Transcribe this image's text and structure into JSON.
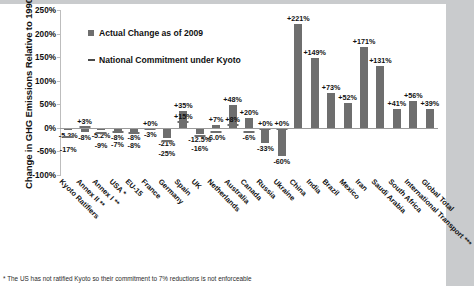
{
  "legend": {
    "series_actual": "Actual Change as of 2009",
    "series_commitment": "National Commitment under Kyoto",
    "marker_actual": "square-marker",
    "marker_commitment": "dash-marker"
  },
  "footnote": "* The US has not ratified Kyoto so their commitment to 7% reductions is not enforceable",
  "chart_data": {
    "type": "bar",
    "title": "",
    "xlabel": "",
    "ylabel": "Change in GHG Emissions Relative to 1990",
    "ylim": [
      -100,
      250
    ],
    "yticks": [
      "250%",
      "200%",
      "150%",
      "100%",
      "50%",
      "0%",
      "-50%",
      "-100%"
    ],
    "ytick_values": [
      250,
      200,
      150,
      100,
      50,
      0,
      -50,
      -100
    ],
    "grid": false,
    "legend_position": "upper-left-inside",
    "categories": [
      "Kyoto Ratifiers",
      "Annex II **",
      "Annex I **",
      "USA *",
      "EU-15",
      "France",
      "Germany",
      "Spain",
      "UK",
      "Netherlands",
      "Australia",
      "Canada",
      "Russia",
      "Ukraine",
      "China",
      "India",
      "Brazil",
      "Mexico",
      "Iran",
      "Saudi Arabia",
      "South Africa",
      "International Transport ***",
      "Global Total"
    ],
    "series": [
      {
        "name": "Actual Change as of 2009",
        "values": [
          -5.2,
          -8,
          -5.2,
          -8,
          -8,
          -3,
          -21,
          35,
          -12.5,
          7,
          48,
          20,
          -33,
          -60,
          221,
          149,
          73,
          52,
          171,
          131,
          41,
          56,
          39
        ],
        "labels": [
          "-5.2%",
          "-8%",
          "-5.2%",
          "-8%",
          "-8%",
          "-3%",
          "-21%",
          "+35%",
          "-12.5%",
          "+7%",
          "+48%",
          "+20%",
          "-33%",
          "-60%",
          "+221%",
          "+149%",
          "+73%",
          "+52%",
          "+171%",
          "+131%",
          "+41%",
          "+56%",
          "+39%"
        ]
      },
      {
        "name": "National Commitment under Kyoto",
        "values": [
          -17,
          3,
          -9,
          -7,
          -8,
          0,
          -25,
          15,
          -16,
          -6,
          8,
          -6,
          0,
          0,
          null,
          null,
          null,
          null,
          null,
          null,
          null,
          null,
          null
        ],
        "labels": [
          "-17%",
          "+3%",
          "-9%",
          "-7%",
          "-8%",
          "+0%",
          "-25%",
          "+15%",
          "-16%",
          "-6.0%",
          "+8%",
          "-6%",
          "+0%",
          "+0%",
          "",
          "",
          "",
          "",
          "",
          "",
          "",
          "",
          ""
        ]
      }
    ]
  }
}
